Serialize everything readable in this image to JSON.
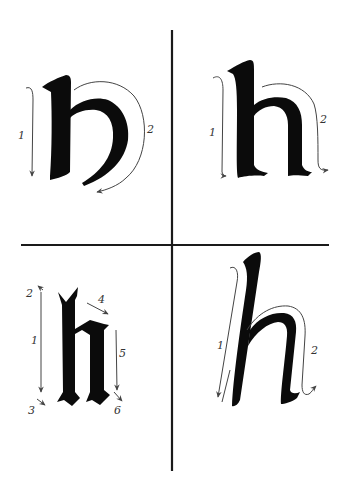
{
  "figure": {
    "divider_color": "#1a1a1a",
    "ink_color": "#0b0b0b",
    "arrow_color": "#444444"
  },
  "panels": [
    {
      "id": "top-left",
      "letter": "h",
      "style": "uncial",
      "stroke_labels": [
        "1",
        "2"
      ]
    },
    {
      "id": "top-right",
      "letter": "h",
      "style": "foundational",
      "stroke_labels": [
        "1",
        "2"
      ]
    },
    {
      "id": "bottom-left",
      "letter": "h",
      "style": "blackletter",
      "stroke_labels": [
        "2",
        "1",
        "3",
        "4",
        "5",
        "6"
      ]
    },
    {
      "id": "bottom-right",
      "letter": "h",
      "style": "italic",
      "stroke_labels": [
        "1",
        "2"
      ]
    }
  ]
}
